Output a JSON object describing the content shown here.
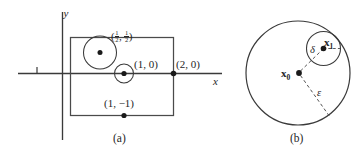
{
  "figure": {
    "panels": [
      {
        "id": "a",
        "caption": "(a)",
        "type": "cartesian-square",
        "axis_x_label": "x",
        "axis_y_label": "y",
        "description": "Square region in the plane with marked points and neighborhood disks",
        "points": [
          {
            "name": "half-half",
            "label_text": "( , )",
            "numerator": "1",
            "denominator": "2",
            "has_disk": true,
            "disk_kind": "large"
          },
          {
            "name": "one-zero",
            "label_text": "(1, 0)",
            "has_disk": true,
            "disk_kind": "small"
          },
          {
            "name": "one-minus-one",
            "label_text": "(1, −1)",
            "has_disk": false
          },
          {
            "name": "two-zero",
            "label_text": "(2, 0)",
            "has_disk": false
          }
        ]
      },
      {
        "id": "b",
        "caption": "(b)",
        "type": "nested-disks",
        "description": "Large epsilon-ball about x0 containing a smaller delta-ball about x1",
        "center_label": "x",
        "center_sub": "0",
        "inner_label": "x",
        "inner_sub": "1",
        "radius_outer_label": "ε",
        "radius_inner_label": "δ"
      }
    ]
  },
  "style": {
    "ink": "#262626",
    "line": "#3a3a3a",
    "background": "#ffffff"
  }
}
